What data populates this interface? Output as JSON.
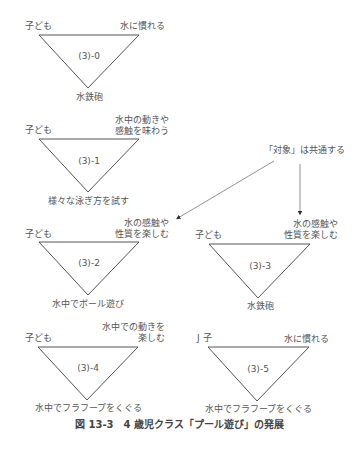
{
  "diagrams": [
    {
      "id": "(3)-0",
      "left": "子ども",
      "right": "水に慣れる",
      "bottom": "水鉄砲"
    },
    {
      "id": "(3)-1",
      "left": "子ども",
      "right": "水中の動きや\n感触を味わう",
      "right_lines": [
        "水中の動きや",
        "感触を味わう"
      ],
      "bottom": "様々な泳ぎ方を試す"
    },
    {
      "id": "(3)-2",
      "left": "子ども",
      "right_lines": [
        "水の感触や",
        "性質を楽しむ"
      ],
      "bottom": "水中でボール遊び"
    },
    {
      "id": "(3)-3",
      "left": "子ども",
      "right_lines": [
        "水の感触や",
        "性質を楽しむ"
      ],
      "bottom": "水鉄砲"
    },
    {
      "id": "(3)-4",
      "left": "子ども",
      "right_lines": [
        "水中での動きを",
        "楽しむ"
      ],
      "bottom": "水中でフラフープをくぐる"
    },
    {
      "id": "(3)-5",
      "left": "J 子",
      "right": "水に慣れる",
      "bottom": "水中でフラフープをくぐる"
    }
  ],
  "annotation": {
    "text": "「対象」は共通する"
  },
  "caption": "図 13-3　4 歳児クラス「プール遊び」の発展"
}
